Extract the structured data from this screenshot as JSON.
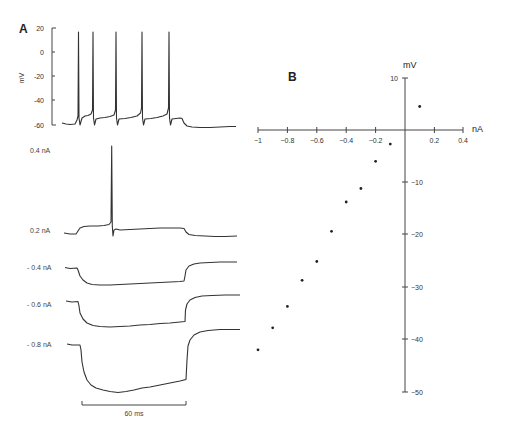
{
  "chart_data": [
    {
      "panel": "A",
      "type": "line",
      "title": "",
      "ylabel": "mV",
      "xlabel": "",
      "yticks": [
        20,
        0,
        -20,
        -40,
        -60
      ],
      "ylim": [
        -60,
        20
      ],
      "scale_bar": {
        "label": "60 ms",
        "duration_ms": 60
      },
      "series": [
        {
          "name": "0.4 nA",
          "label": "0.4 nA",
          "description": "repetitive firing, 5 action potentials overshooting to ~+15 mV from ~-58 mV baseline; after step, hyperpolarization to ~-62 mV",
          "spike_count": 5
        },
        {
          "name": "0.2 nA",
          "label": "0.2 nA",
          "description": "depolarizing step with a single action potential",
          "spike_count": 1
        },
        {
          "name": "-0.4 nA",
          "label": "- 0.4 nA",
          "description": "hyperpolarizing response with rebound after step",
          "spike_count": 0
        },
        {
          "name": "-0.6 nA",
          "label": "- 0.6 nA",
          "description": "larger hyperpolarizing response with sag and rebound",
          "spike_count": 0
        },
        {
          "name": "-0.8 nA",
          "label": "- 0.8 nA",
          "description": "largest hyperpolarizing response with sag and rebound",
          "spike_count": 0
        }
      ]
    },
    {
      "panel": "B",
      "type": "scatter",
      "title": "",
      "xlabel": "nA",
      "ylabel": "mV",
      "xlim": [
        -1,
        0.4
      ],
      "ylim": [
        -50,
        10
      ],
      "xticks": [
        -1,
        -0.8,
        -0.6,
        -0.4,
        -0.2,
        0.2,
        0.4
      ],
      "xtick_labels": [
        "−1",
        "−0.8",
        "−0.6",
        "−0.4",
        "−0.2",
        "0.2",
        "0.4"
      ],
      "yticks": [
        10,
        -10,
        -20,
        -30,
        -40,
        -50
      ],
      "ytick_labels": [
        "10",
        "−10",
        "−20",
        "−30",
        "−40",
        "−50"
      ],
      "grid": false,
      "x": [
        0.1,
        -0.1,
        -0.2,
        -0.3,
        -0.4,
        -0.5,
        -0.6,
        -0.7,
        -0.8,
        -0.9,
        -1.0
      ],
      "y": [
        4.5,
        -2.7,
        -6.0,
        -11.2,
        -13.8,
        -19.4,
        -25.2,
        -28.8,
        -33.8,
        -37.9,
        -42.1
      ]
    }
  ],
  "panels": {
    "a": {
      "label": "A",
      "y_unit": "mV",
      "ytick_labels": [
        "20",
        "0",
        "-20",
        "-40",
        "-60"
      ],
      "trace_labels": [
        "0.4 nA",
        "0.2 nA",
        "- 0.4 nA",
        "- 0.6 nA",
        "- 0.8 nA"
      ],
      "scale_bar_label": "60 ms"
    },
    "b": {
      "label": "B",
      "x_unit": "nA",
      "y_unit": "mV",
      "xtick_labels": [
        "−1",
        "−0.8",
        "−0.6",
        "−0.4",
        "−0.2",
        "0.2",
        "0.4"
      ],
      "ytick_labels": [
        "10",
        "−10",
        "−20",
        "−30",
        "−40",
        "−50"
      ]
    }
  }
}
